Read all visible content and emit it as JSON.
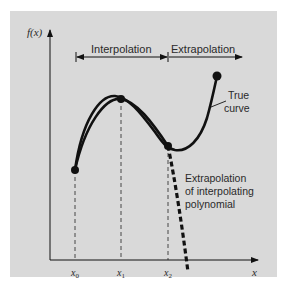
{
  "figure": {
    "y_axis_label": "f(x)",
    "x_axis_label": "x",
    "region_labels": {
      "interpolation": "Interpolation",
      "extrapolation": "Extrapolation"
    },
    "annotations": {
      "true_curve_line1": "True",
      "true_curve_line2": "curve",
      "extrap_line1": "Extrapolation",
      "extrap_line2": "of interpolating",
      "extrap_line3": "polynomial"
    },
    "ticks": [
      {
        "label": "x",
        "sub": "0"
      },
      {
        "label": "x",
        "sub": "1"
      },
      {
        "label": "x",
        "sub": "2"
      }
    ],
    "colors": {
      "background": "#d9d9d9",
      "ink": "#111111",
      "text": "#2a2a2a"
    }
  }
}
